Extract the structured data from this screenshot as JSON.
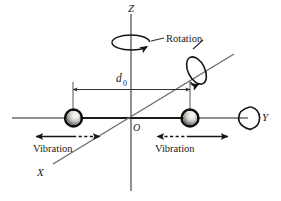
{
  "figure": {
    "type": "schematic-diagram",
    "background_color": "#ffffff",
    "line_color": "#4a4a4a",
    "bold_line_color": "#151515",
    "text_color": "#1a1a1a"
  },
  "axes": {
    "z": {
      "label": "Z",
      "orientation": "vertical"
    },
    "y": {
      "label": "Y",
      "orientation": "horizontal"
    },
    "x": {
      "label": "X",
      "orientation": "diagonal"
    },
    "origin": {
      "label": "O"
    }
  },
  "dimension": {
    "label": "d",
    "subscript": "0",
    "description": "separation between the two masses"
  },
  "annotations": {
    "rotation_label": "Rotation",
    "vibration_left_label": "Vibration",
    "vibration_right_label": "Vibration"
  },
  "masses": [
    {
      "name": "left-mass",
      "position": "left of origin on Y axis"
    },
    {
      "name": "right-mass",
      "position": "right of origin on Y axis"
    }
  ],
  "rotation_markers": [
    {
      "name": "z-axis-rotation",
      "about": "Z"
    },
    {
      "name": "x-axis-rotation",
      "about": "X"
    },
    {
      "name": "y-axis-rotation",
      "about": "Y"
    }
  ],
  "vibration_arrows": [
    {
      "name": "left-solid-arrow",
      "style": "solid",
      "direction": "left"
    },
    {
      "name": "left-dashed-arrow",
      "style": "dashed",
      "direction": "right"
    },
    {
      "name": "right-dashed-arrow",
      "style": "dashed",
      "direction": "left"
    },
    {
      "name": "right-solid-arrow",
      "style": "solid",
      "direction": "right"
    }
  ]
}
